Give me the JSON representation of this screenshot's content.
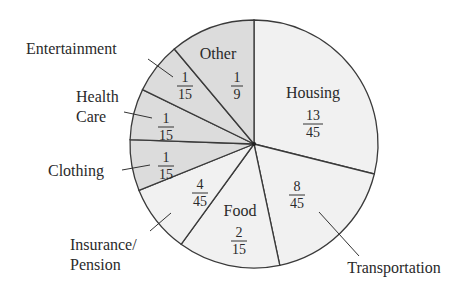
{
  "chart_data": {
    "type": "pie",
    "title": "",
    "start_angle_deg": 0,
    "direction": "clockwise",
    "slices": [
      {
        "label": "Housing",
        "fraction": "13/45",
        "num": 13,
        "den": 45,
        "value": 0.2889,
        "fill": "#f1f1f1"
      },
      {
        "label": "Transportation",
        "fraction": "8/45",
        "num": 8,
        "den": 45,
        "value": 0.1778,
        "fill": "#f1f1f1"
      },
      {
        "label": "Food",
        "fraction": "2/15",
        "num": 2,
        "den": 15,
        "value": 0.1333,
        "fill": "#f1f1f1"
      },
      {
        "label": "Insurance/ Pension",
        "fraction": "4/45",
        "num": 4,
        "den": 45,
        "value": 0.0889,
        "fill": "#f1f1f1"
      },
      {
        "label": "Clothing",
        "fraction": "1/15",
        "num": 1,
        "den": 15,
        "value": 0.0667,
        "fill": "#dcdcdc"
      },
      {
        "label": "Health Care",
        "fraction": "1/15",
        "num": 1,
        "den": 15,
        "value": 0.0667,
        "fill": "#dcdcdc"
      },
      {
        "label": "Entertainment",
        "fraction": "1/15",
        "num": 1,
        "den": 15,
        "value": 0.0667,
        "fill": "#dcdcdc"
      },
      {
        "label": "Other",
        "fraction": "1/9",
        "num": 1,
        "den": 9,
        "value": 0.1111,
        "fill": "#dcdcdc"
      }
    ],
    "legend": "none",
    "grid": false
  },
  "labels": {
    "housing": {
      "name": "Housing",
      "num": "13",
      "den": "45"
    },
    "transportation": {
      "name": "Transportation",
      "num": "8",
      "den": "45"
    },
    "food": {
      "name": "Food",
      "num": "2",
      "den": "15"
    },
    "insurance": {
      "name_line1": "Insurance/",
      "name_line2": "Pension",
      "num": "4",
      "den": "45"
    },
    "clothing": {
      "name": "Clothing",
      "num": "1",
      "den": "15"
    },
    "health": {
      "name_line1": "Health",
      "name_line2": "Care",
      "num": "1",
      "den": "15"
    },
    "entertainment": {
      "name": "Entertainment",
      "num": "1",
      "den": "15"
    },
    "other": {
      "name": "Other",
      "num": "1",
      "den": "9"
    }
  }
}
